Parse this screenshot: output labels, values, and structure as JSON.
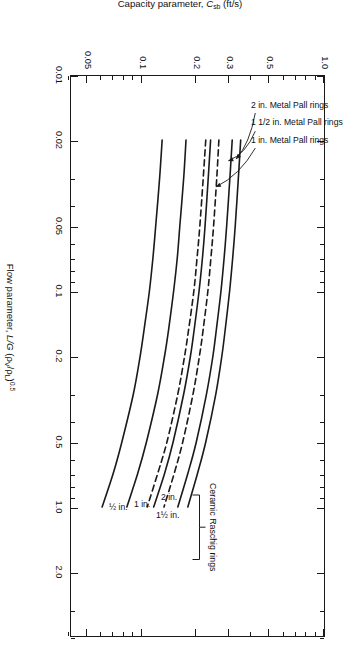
{
  "figure": {
    "type": "log-log capacity correlation chart",
    "rotation_deg": 90,
    "background": "#ffffff",
    "line_color": "#1a1a1a"
  },
  "axes": {
    "x": {
      "title_plain": "Flow parameter, L/G (ρV/ρL)0.5",
      "title_prefix": "Flow parameter, ",
      "title_var": "L/G",
      "title_paren_open": " (",
      "title_rho_v": "ρ",
      "title_rho_v_sub": "V",
      "title_slash": "/",
      "title_rho_l": "ρ",
      "title_rho_l_sub": "L",
      "title_paren_close": ")",
      "title_exp": "0.5",
      "scale": "log",
      "min": 0.01,
      "max": 4.0,
      "major_ticks": [
        0.01,
        0.02,
        0.05,
        0.1,
        0.2,
        0.5,
        1.0,
        2.0
      ],
      "major_tick_labels": [
        "0.01",
        "0.02",
        "0.05",
        "0.1",
        "0.2",
        "0.5",
        "1.0",
        "2.0"
      ],
      "minor_ticks": [
        0.03,
        0.04,
        0.06,
        0.07,
        0.08,
        0.09,
        0.3,
        0.4,
        0.6,
        0.7,
        0.8,
        0.9,
        3.0,
        4.0
      ]
    },
    "y": {
      "title_prefix": "Capacity parameter, ",
      "title_var": "C",
      "title_var_sub": "sb",
      "title_units": " (ft/s)",
      "scale": "log",
      "min": 0.04,
      "max": 1.0,
      "major_ticks": [
        0.05,
        0.1,
        0.2,
        0.3,
        0.5,
        1.0
      ],
      "major_tick_labels": [
        "0.05",
        "0.1",
        "0.2",
        "0.3",
        "0.5",
        "1.0"
      ],
      "minor_ticks": [
        0.04,
        0.06,
        0.07,
        0.08,
        0.09,
        0.4,
        0.6,
        0.7,
        0.8,
        0.9
      ]
    }
  },
  "annotations": {
    "pall_rings": [
      {
        "label": "2 in. Metal Pall rings"
      },
      {
        "label": "1 1/2 in. Metal Pall rings"
      },
      {
        "label": "1 in. Metal Pall rings"
      }
    ],
    "raschig_group_label": "Ceramic Raschig rings",
    "raschig_sizes": [
      {
        "label": "2 in."
      },
      {
        "label": "1½ in."
      },
      {
        "label": "1 in."
      },
      {
        "label": "½ in."
      }
    ]
  },
  "chart_data": {
    "type": "line",
    "title": "",
    "xlabel": "Flow parameter, L/G (ρV/ρL)^0.5",
    "ylabel": "Capacity parameter, Csb (ft/s)",
    "xscale": "log",
    "yscale": "log",
    "xlim": [
      0.01,
      4.0
    ],
    "ylim": [
      0.04,
      1.0
    ],
    "grid": false,
    "legend": "inline annotations with leader arrows",
    "series": [
      {
        "name": "2 in. Metal Pall rings",
        "style": "solid",
        "x": [
          0.02,
          0.03,
          0.05,
          0.07,
          0.1,
          0.15,
          0.2,
          0.3,
          0.5,
          0.7,
          1.0
        ],
        "y": [
          0.345,
          0.335,
          0.322,
          0.312,
          0.3,
          0.284,
          0.272,
          0.252,
          0.222,
          0.2,
          0.177
        ]
      },
      {
        "name": "1 1/2 in. Metal Pall rings",
        "style": "solid",
        "x": [
          0.02,
          0.03,
          0.05,
          0.07,
          0.1,
          0.15,
          0.2,
          0.3,
          0.5,
          0.7,
          1.0
        ],
        "y": [
          0.31,
          0.301,
          0.289,
          0.28,
          0.269,
          0.254,
          0.243,
          0.224,
          0.197,
          0.177,
          0.156
        ]
      },
      {
        "name": "1 in. Metal Pall rings",
        "style": "dashed",
        "x": [
          0.02,
          0.03,
          0.05,
          0.07,
          0.1,
          0.15,
          0.2,
          0.3,
          0.5,
          0.7,
          1.0
        ],
        "y": [
          0.262,
          0.255,
          0.245,
          0.237,
          0.228,
          0.215,
          0.205,
          0.189,
          0.166,
          0.149,
          0.131
        ]
      },
      {
        "name": "2 in. Ceramic Raschig rings",
        "style": "solid",
        "x": [
          0.02,
          0.03,
          0.05,
          0.07,
          0.1,
          0.15,
          0.2,
          0.3,
          0.5,
          0.7,
          1.0
        ],
        "y": [
          0.236,
          0.229,
          0.22,
          0.213,
          0.204,
          0.192,
          0.183,
          0.168,
          0.147,
          0.132,
          0.115
        ]
      },
      {
        "name": "1½ in. Ceramic Raschig rings",
        "style": "dashed",
        "x": [
          0.02,
          0.03,
          0.05,
          0.07,
          0.1,
          0.15,
          0.2,
          0.3,
          0.5,
          0.7,
          1.0
        ],
        "y": [
          0.222,
          0.215,
          0.206,
          0.199,
          0.191,
          0.179,
          0.17,
          0.156,
          0.136,
          0.121,
          0.106
        ]
      },
      {
        "name": "1 in. Ceramic Raschig rings",
        "style": "solid",
        "x": [
          0.02,
          0.03,
          0.05,
          0.07,
          0.1,
          0.15,
          0.2,
          0.3,
          0.5,
          0.7,
          1.0
        ],
        "y": [
          0.173,
          0.168,
          0.16,
          0.155,
          0.148,
          0.139,
          0.132,
          0.121,
          0.105,
          0.094,
          0.082
        ]
      },
      {
        "name": "½ in. Ceramic Raschig rings",
        "style": "solid",
        "x": [
          0.02,
          0.03,
          0.05,
          0.07,
          0.1,
          0.15,
          0.2,
          0.3,
          0.5,
          0.7,
          1.0
        ],
        "y": [
          0.128,
          0.124,
          0.118,
          0.114,
          0.109,
          0.102,
          0.097,
          0.089,
          0.077,
          0.069,
          0.06
        ]
      }
    ]
  }
}
